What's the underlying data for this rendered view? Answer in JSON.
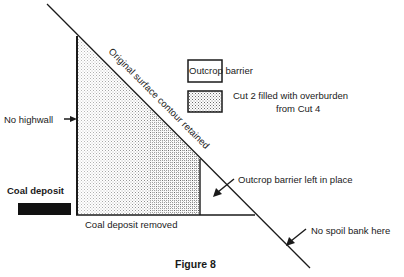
{
  "figure": {
    "caption": "Figure 8",
    "diagonal_label": "Original surface contour retained"
  },
  "legend": {
    "items": [
      {
        "label": "Outcrop barrier",
        "pattern": "blank"
      },
      {
        "label_line1": "Cut 2 filled with overburden",
        "label_line2": "from Cut 4",
        "pattern": "stipple"
      }
    ]
  },
  "annotations": {
    "no_highwall": "No highwall",
    "coal_deposit": "Coal deposit",
    "coal_deposit_removed": "Coal deposit removed",
    "outcrop_barrier_left": "Outcrop barrier left in place",
    "no_spoil_bank": "No spoil bank here"
  },
  "colors": {
    "line": "#1a1a1a",
    "stipple": "#555555",
    "background": "#ffffff"
  }
}
